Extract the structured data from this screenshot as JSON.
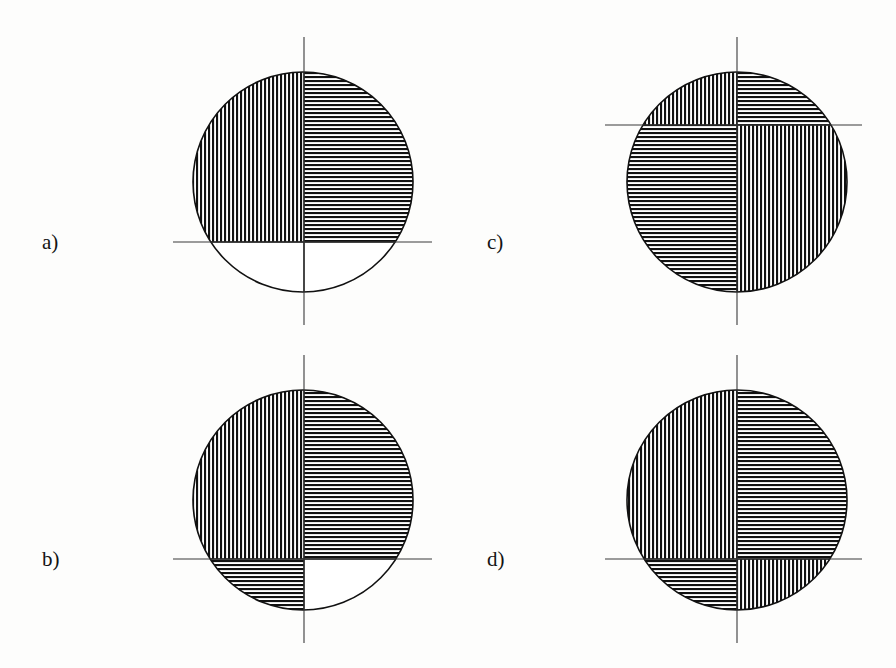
{
  "figure": {
    "background_color": "#fdfdfc",
    "ink_color": "#111111",
    "axis_color": "#3a3a3a",
    "panel_count": 4,
    "hatch_styles": {
      "vertical": "vertical-hatch",
      "horizontal": "horizontal-hatch",
      "empty": "no-hatch"
    },
    "panels": [
      {
        "id": "a",
        "label": "a)",
        "label_x": 42,
        "label_y": 232,
        "circle": {
          "cx": 303,
          "cy": 182,
          "r": 110
        },
        "vertical_axis": {
          "x": 304,
          "y1": 37,
          "y2": 325
        },
        "horizontal_axis": {
          "y": 242,
          "x1": 173,
          "x2": 432
        },
        "axis_offset_note": "horizontal axis 60 px below circle centre",
        "quadrants": {
          "top_left": "vertical",
          "top_right": "horizontal",
          "bottom_left": "empty",
          "bottom_right": "empty"
        }
      },
      {
        "id": "b",
        "label": "b)",
        "label_x": 42,
        "label_y": 549,
        "circle": {
          "cx": 303,
          "cy": 500,
          "r": 110
        },
        "vertical_axis": {
          "x": 304,
          "y1": 355,
          "y2": 643
        },
        "horizontal_axis": {
          "y": 559,
          "x1": 173,
          "x2": 432
        },
        "axis_offset_note": "horizontal axis 59 px below circle centre",
        "quadrants": {
          "top_left": "vertical",
          "top_right": "horizontal",
          "bottom_left": "horizontal",
          "bottom_right": "empty"
        }
      },
      {
        "id": "c",
        "label": "c)",
        "label_x": 487,
        "label_y": 232,
        "circle": {
          "cx": 737,
          "cy": 182,
          "r": 110
        },
        "vertical_axis": {
          "x": 737,
          "y1": 37,
          "y2": 325
        },
        "horizontal_axis": {
          "y": 125,
          "x1": 605,
          "x2": 862
        },
        "axis_offset_note": "horizontal axis 57 px above circle centre",
        "quadrants": {
          "top_left": "vertical",
          "top_right": "horizontal",
          "bottom_left": "horizontal",
          "bottom_right": "vertical"
        }
      },
      {
        "id": "d",
        "label": "d)",
        "label_x": 487,
        "label_y": 549,
        "circle": {
          "cx": 737,
          "cy": 500,
          "r": 110
        },
        "vertical_axis": {
          "x": 737,
          "y1": 355,
          "y2": 643
        },
        "horizontal_axis": {
          "y": 559,
          "x1": 605,
          "x2": 862
        },
        "axis_offset_note": "horizontal axis 59 px below circle centre",
        "quadrants": {
          "top_left": "vertical",
          "top_right": "horizontal",
          "bottom_left": "horizontal",
          "bottom_right": "vertical"
        }
      }
    ]
  }
}
